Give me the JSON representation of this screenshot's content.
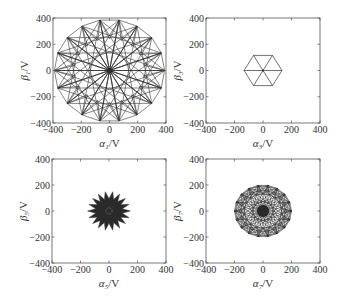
{
  "chart_data": [
    {
      "type": "line",
      "panel": "top-left",
      "title": "",
      "xlabel": "α1/V",
      "ylabel": "β1/V",
      "xlim": [
        -400,
        400
      ],
      "ylim": [
        -400,
        400
      ],
      "xticks": [
        -400,
        -200,
        0,
        200,
        400
      ],
      "yticks": [
        -400,
        -200,
        0,
        200,
        400
      ],
      "grid": false,
      "pattern": {
        "kind": "star-polygon-mesh",
        "points": 18,
        "radius": 390,
        "connect_steps": [
          1,
          5,
          7,
          9
        ]
      }
    },
    {
      "type": "line",
      "panel": "top-right",
      "title": "",
      "xlabel": "α3/V",
      "ylabel": "β3/V",
      "xlim": [
        -400,
        400
      ],
      "ylim": [
        -400,
        400
      ],
      "xticks": [
        -400,
        -200,
        0,
        200,
        400
      ],
      "yticks": [
        -400,
        -200,
        0,
        200,
        400
      ],
      "grid": false,
      "pattern": {
        "kind": "hexagon-spokes",
        "points": 6,
        "radius": 133
      }
    },
    {
      "type": "line",
      "panel": "bottom-left",
      "title": "",
      "xlabel": "α5/V",
      "ylabel": "β5/V",
      "xlim": [
        -400,
        400
      ],
      "ylim": [
        -400,
        400
      ],
      "xticks": [
        -400,
        -200,
        0,
        200,
        400
      ],
      "yticks": [
        -400,
        -200,
        0,
        200,
        400
      ],
      "grid": false,
      "pattern": {
        "kind": "filled-star",
        "points": 18,
        "outer_radius": 150,
        "inner_radius": 95,
        "center_ring_radius": 22
      }
    },
    {
      "type": "line",
      "panel": "bottom-right",
      "title": "",
      "xlabel": "α7/V",
      "ylabel": "β7/V",
      "xlim": [
        -400,
        400
      ],
      "ylim": [
        -400,
        400
      ],
      "xticks": [
        -400,
        -200,
        0,
        200,
        400
      ],
      "yticks": [
        -400,
        -200,
        0,
        200,
        400
      ],
      "grid": false,
      "pattern": {
        "kind": "dense-mesh",
        "points": 18,
        "radius": 200,
        "connect_steps": [
          1,
          2,
          4,
          5,
          7,
          8
        ]
      }
    }
  ],
  "axes_px": [
    {
      "x0": 53,
      "y0": 18,
      "x1": 166,
      "y1": 123
    },
    {
      "x0": 206,
      "y0": 18,
      "x1": 320,
      "y1": 123
    },
    {
      "x0": 52,
      "y0": 159,
      "x1": 166,
      "y1": 263
    },
    {
      "x0": 206,
      "y0": 159,
      "x1": 320,
      "y1": 263
    }
  ],
  "colors": {
    "line": "#333333",
    "fill": "#2a2a2a",
    "axis": "#555555",
    "ring": "#999999"
  }
}
